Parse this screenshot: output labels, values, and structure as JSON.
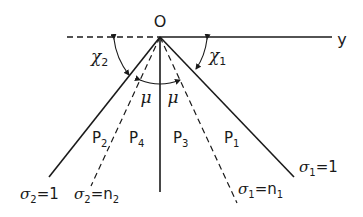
{
  "figure": {
    "origin_label": "O",
    "axis_label": "y",
    "angles": {
      "chi1": {
        "symbol": "χ",
        "sub": "1"
      },
      "chi2": {
        "symbol": "χ",
        "sub": "2"
      },
      "mu_left": "μ",
      "mu_right": "μ"
    },
    "regions": {
      "P1": {
        "main": "P",
        "sub": "1"
      },
      "P2": {
        "main": "P",
        "sub": "2"
      },
      "P3": {
        "main": "P",
        "sub": "3"
      },
      "P4": {
        "main": "P",
        "sub": "4"
      }
    },
    "lines": {
      "sigma2_eq_1": {
        "sym": "σ",
        "sub": "2",
        "rhs": "=1"
      },
      "sigma2_eq_n2": {
        "sym": "σ",
        "sub": "2",
        "rhs": "=n",
        "rhs_sub": "2"
      },
      "sigma1_eq_n1": {
        "sym": "σ",
        "sub": "1",
        "rhs": "=n",
        "rhs_sub": "1"
      },
      "sigma1_eq_1": {
        "sym": "σ",
        "sub": "1",
        "rhs": "=1"
      }
    },
    "colors": {
      "ink": "#1a1a1a",
      "background": "#ffffff"
    }
  }
}
